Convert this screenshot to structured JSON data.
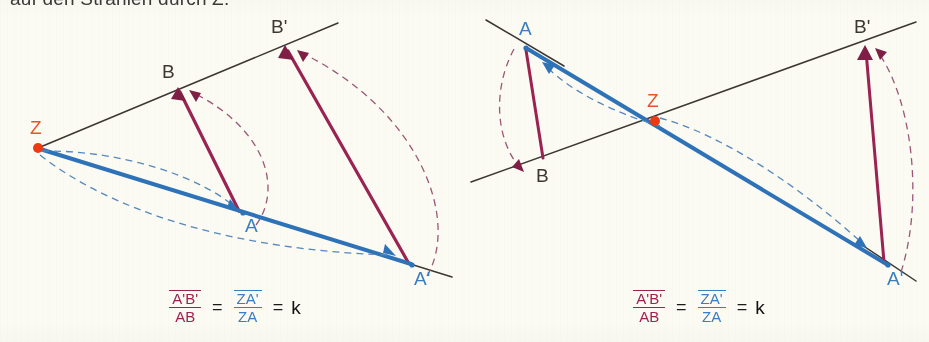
{
  "page": {
    "clipped_heading": "auf den Strahlen durch Z.",
    "background_color": "#fbfaf3"
  },
  "colors": {
    "ray_line": "#3c3733",
    "blue_vector": "#2e72b8",
    "blue_label": "#3a7ebf",
    "magenta_vector": "#9b2352",
    "magenta_dash": "#9b5878",
    "center_point": "#ee3a12",
    "center_label": "#e8542a",
    "ink": "#1a1a1a"
  },
  "figures": [
    {
      "id": "figure-left",
      "name": "zentrische-streckung-positiver-faktor",
      "center_label": "Z",
      "points": [
        {
          "label": "Z",
          "x": 38,
          "y": 148,
          "color": "#e8542a",
          "label_dx": -8,
          "label_dy": -14
        },
        {
          "label": "B",
          "x": 178,
          "y": 88,
          "color": "#3c3733",
          "label_dx": -16,
          "label_dy": -10
        },
        {
          "label": "B'",
          "x": 285,
          "y": 45,
          "color": "#3c3733",
          "label_dx": -6,
          "label_dy": -12
        },
        {
          "label": "A",
          "x": 243,
          "y": 214,
          "color": "#3a7ebf",
          "label_dx": 2,
          "label_dy": 18
        },
        {
          "label": "A'",
          "x": 412,
          "y": 265,
          "color": "#3a7ebf",
          "label_dx": 2,
          "label_dy": 20
        }
      ],
      "formula": {
        "numerator_red": "A'B'",
        "denominator_red": "AB",
        "equals_1": "=",
        "numerator_blue": "ZA'",
        "denominator_blue": "ZA",
        "equals_2": "=",
        "result": "k"
      }
    },
    {
      "id": "figure-right",
      "name": "zentrische-streckung-negativer-faktor",
      "center_label": "Z",
      "points": [
        {
          "label": "A",
          "x": 61,
          "y": 47,
          "color": "#3a7ebf",
          "label_dx": -4,
          "label_dy": -12
        },
        {
          "label": "Z",
          "x": 191,
          "y": 121,
          "color": "#e8542a",
          "label_dx": -6,
          "label_dy": -14
        },
        {
          "label": "B",
          "x": 78,
          "y": 162,
          "color": "#3c3733",
          "label_dx": -4,
          "label_dy": 20
        },
        {
          "label": "B'",
          "x": 401,
          "y": 45,
          "color": "#3c3733",
          "label_dx": -8,
          "label_dy": -12
        },
        {
          "label": "A'",
          "x": 424,
          "y": 265,
          "color": "#3a7ebf",
          "label_dx": 0,
          "label_dy": 20
        }
      ],
      "formula": {
        "numerator_red": "A'B'",
        "denominator_red": "AB",
        "equals_1": "=",
        "numerator_blue": "ZA'",
        "denominator_blue": "ZA",
        "equals_2": "=",
        "result": "k"
      }
    }
  ]
}
